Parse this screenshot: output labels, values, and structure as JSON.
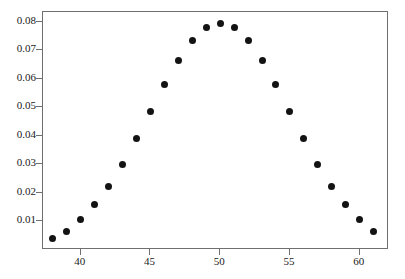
{
  "chart_data": {
    "type": "scatter",
    "title": "",
    "subtitle": "",
    "xlabel": "",
    "ylabel": "",
    "xlim": [
      37.3,
      62.1
    ],
    "ylim": [
      0.0,
      0.0835
    ],
    "grid": false,
    "legend": null,
    "marker": {
      "shape": "circle",
      "color": "#131313",
      "size_px": 7
    },
    "frame_color": "#6f6f6f",
    "background": "#ffffff",
    "x_ticks": [
      40,
      45,
      50,
      55,
      60
    ],
    "x_tick_labels": [
      "40",
      "45",
      "50",
      "55",
      "60"
    ],
    "y_ticks": [
      0.01,
      0.02,
      0.03,
      0.04,
      0.05,
      0.06,
      0.07,
      0.08
    ],
    "y_tick_labels": [
      "0.01",
      "0.02",
      "0.03",
      "0.04",
      "0.05",
      "0.06",
      "0.07",
      "0.08"
    ],
    "x": [
      38,
      39,
      40,
      41,
      42,
      43,
      44,
      45,
      46,
      47,
      48,
      49,
      50,
      51,
      52,
      53,
      54,
      55,
      56,
      57,
      58,
      59,
      60,
      61
    ],
    "y": [
      0.0039,
      0.0066,
      0.0108,
      0.0159,
      0.0223,
      0.0301,
      0.039,
      0.0485,
      0.058,
      0.0666,
      0.0735,
      0.078,
      0.0796,
      0.078,
      0.0735,
      0.0666,
      0.058,
      0.0485,
      0.039,
      0.0301,
      0.0223,
      0.0159,
      0.0108,
      0.0066
    ],
    "points": [
      {
        "x": 38,
        "y": 0.0039
      },
      {
        "x": 39,
        "y": 0.0066
      },
      {
        "x": 40,
        "y": 0.0108
      },
      {
        "x": 41,
        "y": 0.0159
      },
      {
        "x": 42,
        "y": 0.0223
      },
      {
        "x": 43,
        "y": 0.0301
      },
      {
        "x": 44,
        "y": 0.039
      },
      {
        "x": 45,
        "y": 0.0485
      },
      {
        "x": 46,
        "y": 0.058
      },
      {
        "x": 47,
        "y": 0.0666
      },
      {
        "x": 48,
        "y": 0.0735
      },
      {
        "x": 49,
        "y": 0.078
      },
      {
        "x": 50,
        "y": 0.0796
      },
      {
        "x": 51,
        "y": 0.078
      },
      {
        "x": 52,
        "y": 0.0735
      },
      {
        "x": 53,
        "y": 0.0666
      },
      {
        "x": 54,
        "y": 0.058
      },
      {
        "x": 55,
        "y": 0.0485
      },
      {
        "x": 56,
        "y": 0.039
      },
      {
        "x": 57,
        "y": 0.0301
      },
      {
        "x": 58,
        "y": 0.0223
      },
      {
        "x": 59,
        "y": 0.0159
      },
      {
        "x": 60,
        "y": 0.0108
      },
      {
        "x": 61,
        "y": 0.0066
      }
    ]
  }
}
